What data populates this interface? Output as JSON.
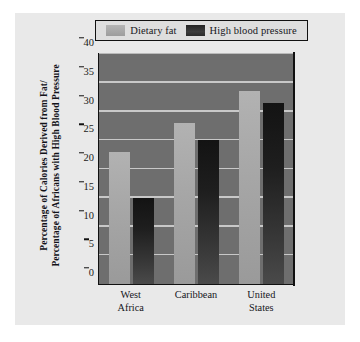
{
  "chart_data": {
    "type": "bar",
    "title": "",
    "xlabel": "",
    "ylabel": "Percentage of Calories Derived from Fat/ Percentage of Africans with High Blood Pressure",
    "ylabel_lines": [
      "Percentage of Calories Derived from Fat/",
      "Percentage of Africans with High Blood Pressure"
    ],
    "categories": [
      "West Africa",
      "Caribbean",
      "United States"
    ],
    "category_lines": [
      [
        "West",
        "Africa"
      ],
      [
        "Caribbean",
        ""
      ],
      [
        "United",
        "States"
      ]
    ],
    "series": [
      {
        "name": "Dietary fat",
        "values": [
          23,
          28,
          33.5
        ],
        "color": "#a8a8a8"
      },
      {
        "name": "High blood pressure",
        "values": [
          15,
          25,
          31.5
        ],
        "color": "#1d1d1d"
      }
    ],
    "ylim": [
      0,
      40
    ],
    "yticks": [
      0,
      5,
      10,
      15,
      20,
      25,
      30,
      35,
      40
    ],
    "ytick_labels": [
      "0",
      "5",
      "10",
      "15",
      "20",
      "25",
      "30",
      "35",
      "40"
    ],
    "grid": true,
    "legend_position": "top",
    "plot_background": "#6e6e6e",
    "gridline_color": "#d8d8d8",
    "card_background": "#e9e9e9",
    "axis_color": "#111111"
  }
}
